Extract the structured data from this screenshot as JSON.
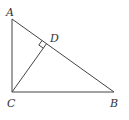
{
  "diagram": {
    "type": "geometry",
    "points": {
      "A": {
        "label": "A",
        "x": 12,
        "y": 19
      },
      "B": {
        "label": "B",
        "x": 114,
        "y": 92
      },
      "C": {
        "label": "C",
        "x": 12,
        "y": 92
      },
      "D": {
        "label": "D",
        "x": 46.5,
        "y": 43.7
      }
    },
    "labels": {
      "A": "A",
      "B": "B",
      "C": "C",
      "D": "D"
    },
    "segments": [
      "AB",
      "AC",
      "BC",
      "CD"
    ],
    "right_angle_markers": [
      "D"
    ],
    "colors": {
      "stroke": "#444444",
      "text": "#333333",
      "background": "#ffffff"
    }
  }
}
